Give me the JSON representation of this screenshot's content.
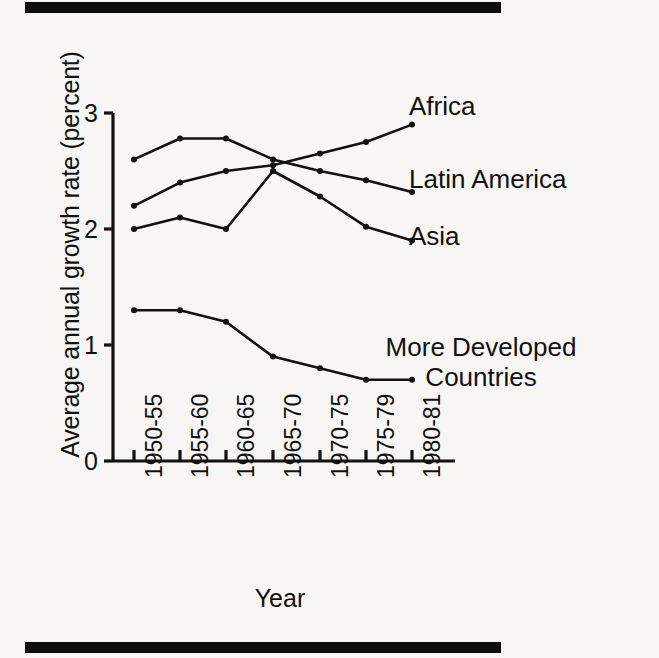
{
  "chart_data": {
    "type": "line",
    "title": "",
    "xlabel": "Year",
    "ylabel": "Average annual growth rate (percent)",
    "categories": [
      "1950-55",
      "1955-60",
      "1960-65",
      "1965-70",
      "1970-75",
      "1975-79",
      "1980-81"
    ],
    "ylim": [
      0,
      3
    ],
    "yticks": [
      "0",
      "1",
      "2",
      "3"
    ],
    "ytick_values": [
      0,
      1,
      2,
      3
    ],
    "grid": false,
    "legend": "inline-right-of-line-ends",
    "series": [
      {
        "name": "Africa",
        "values": [
          2.2,
          2.4,
          2.5,
          2.55,
          2.65,
          2.75,
          2.9
        ]
      },
      {
        "name": "Latin America",
        "values": [
          2.6,
          2.78,
          2.78,
          2.6,
          2.5,
          2.42,
          2.32
        ]
      },
      {
        "name": "Asia",
        "values": [
          2.0,
          2.1,
          2.0,
          2.5,
          2.28,
          2.02,
          1.9
        ]
      },
      {
        "name": "More Developed Countries",
        "values": [
          1.3,
          1.3,
          1.2,
          0.9,
          0.8,
          0.7,
          0.7
        ]
      }
    ]
  },
  "figure": {
    "ylabel": "Average annual growth rate (percent)",
    "xlabel": "Year",
    "yticks": [
      "0",
      "1",
      "2",
      "3"
    ],
    "xticks": [
      "1950-55",
      "1955-60",
      "1960-65",
      "1965-70",
      "1970-75",
      "1975-79",
      "1980-81"
    ],
    "series_labels": {
      "africa": "Africa",
      "latin_america": "Latin America",
      "asia": "Asia",
      "more_developed": "More Developed Countries"
    },
    "colors": {
      "ink": "#111111",
      "background": "#f7f6f4",
      "rule": "#0d0d0d"
    }
  }
}
